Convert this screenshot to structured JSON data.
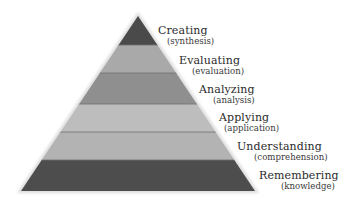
{
  "diagram": {
    "type": "pyramid",
    "title": "",
    "geometry": {
      "apex": [
        138,
        16
      ],
      "base_left": [
        21,
        191
      ],
      "base_right": [
        255,
        191
      ]
    },
    "levels": [
      {
        "name": "Creating",
        "subtitle": "(synthesis)",
        "y_top": 16,
        "y_bottom": 45,
        "fill": "#4a4a4a",
        "label_pos": [
          158,
          25
        ],
        "sub_offset": 9
      },
      {
        "name": "Evaluating",
        "subtitle": "(evaluation)",
        "y_top": 45,
        "y_bottom": 73,
        "fill": "#a9a9a9",
        "label_pos": [
          179,
          55
        ],
        "sub_offset": 13
      },
      {
        "name": "Analyzing",
        "subtitle": "(analysis)",
        "y_top": 73,
        "y_bottom": 104,
        "fill": "#8f8f8f",
        "label_pos": [
          199,
          84
        ],
        "sub_offset": 14
      },
      {
        "name": "Applying",
        "subtitle": "(application)",
        "y_top": 104,
        "y_bottom": 132,
        "fill": "#bdbdbd",
        "label_pos": [
          219,
          112
        ],
        "sub_offset": 5
      },
      {
        "name": "Understanding",
        "subtitle": "(comprehension)",
        "y_top": 132,
        "y_bottom": 160,
        "fill": "#b3b3b3",
        "label_pos": [
          237,
          141
        ],
        "sub_offset": 17
      },
      {
        "name": "Remembering",
        "subtitle": "(knowledge)",
        "y_top": 160,
        "y_bottom": 191,
        "fill": "#4d4d4d",
        "label_pos": [
          259,
          170
        ],
        "sub_offset": 22
      }
    ],
    "colors": {
      "edge_halo": "#d6d6d6",
      "divider": "#6e6e6e",
      "text": "#2b2b2b"
    }
  }
}
